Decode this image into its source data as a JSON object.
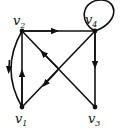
{
  "graph": {
    "type": "directed",
    "vertices": [
      {
        "id": "v1",
        "label": "v",
        "sub": "1",
        "x": 22,
        "y": 107
      },
      {
        "id": "v2",
        "label": "v",
        "sub": "2",
        "x": 22,
        "y": 31
      },
      {
        "id": "v3",
        "label": "v",
        "sub": "3",
        "x": 95,
        "y": 107
      },
      {
        "id": "v4",
        "label": "v",
        "sub": "4",
        "x": 95,
        "y": 31
      }
    ],
    "edges": [
      {
        "from": "v2",
        "to": "v4",
        "shape": "straight"
      },
      {
        "from": "v4",
        "to": "v3",
        "shape": "straight"
      },
      {
        "from": "v1",
        "to": "v2",
        "shape": "straight"
      },
      {
        "from": "v2",
        "to": "v1",
        "shape": "curved"
      },
      {
        "from": "v3",
        "to": "v2",
        "shape": "diagonal"
      },
      {
        "from": "v4",
        "to": "v1",
        "shape": "diagonal"
      },
      {
        "from": "v4",
        "to": "v4",
        "shape": "loop"
      }
    ],
    "colors": {
      "edge": "#111111",
      "node": "#111111",
      "background": "#ffffff"
    }
  }
}
